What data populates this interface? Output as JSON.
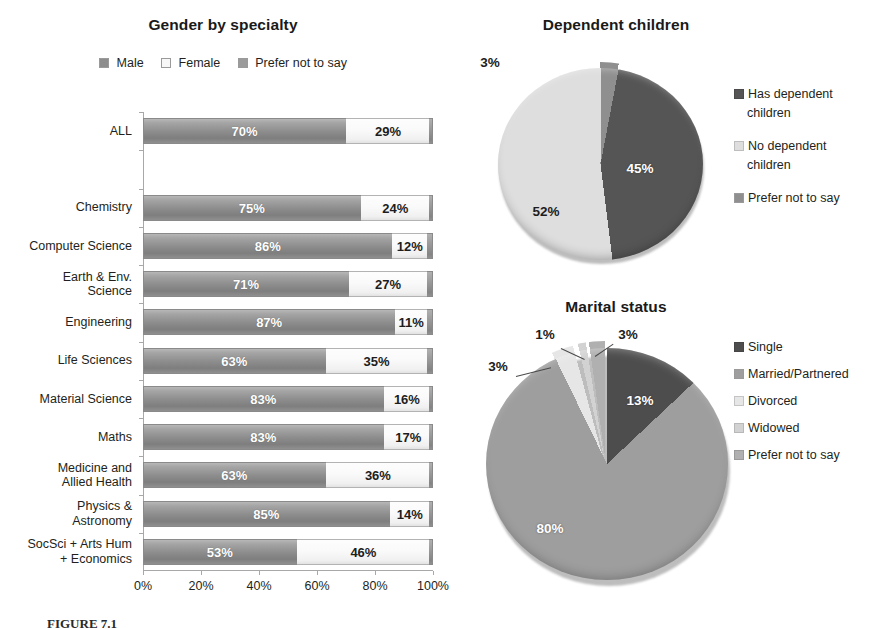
{
  "bar_chart": {
    "title": "Gender by specialty",
    "legend": [
      {
        "label": "Male",
        "color": "#8d8d8d"
      },
      {
        "label": "Female",
        "color": "#f4f4f4"
      },
      {
        "label": "Prefer not to say",
        "color": "#9b9b9b"
      }
    ],
    "xticks": [
      "0%",
      "20%",
      "40%",
      "60%",
      "80%",
      "100%"
    ]
  },
  "chart_data": [
    {
      "type": "bar",
      "orientation": "horizontal",
      "stacked": true,
      "title": "Gender by specialty",
      "xlabel": "",
      "ylabel": "",
      "xlim": [
        0,
        100
      ],
      "grid": false,
      "legend_position": "top",
      "legend": [
        "Male",
        "Female",
        "Prefer not to say"
      ],
      "categories": [
        "ALL",
        "",
        "Chemistry",
        "Computer Science",
        "Earth & Env. Science",
        "Engineering",
        "Life Sciences",
        "Material Science",
        "Maths",
        "Medicine and Allied Health",
        "Physics & Astronomy",
        "SocSci + Arts Hum + Economics"
      ],
      "category_lines": [
        [
          "ALL"
        ],
        [
          ""
        ],
        [
          "Chemistry"
        ],
        [
          "Computer Science"
        ],
        [
          "Earth & Env.",
          "Science"
        ],
        [
          "Engineering"
        ],
        [
          "Life Sciences"
        ],
        [
          "Material Science"
        ],
        [
          "Maths"
        ],
        [
          "Medicine and",
          "Allied Health"
        ],
        [
          "Physics &",
          "Astronomy"
        ],
        [
          "SocSci + Arts Hum",
          "+ Economics"
        ]
      ],
      "series": [
        {
          "name": "Male",
          "values": [
            70,
            null,
            75,
            86,
            71,
            87,
            63,
            83,
            83,
            63,
            85,
            53
          ]
        },
        {
          "name": "Female",
          "values": [
            29,
            null,
            24,
            12,
            27,
            11,
            35,
            16,
            17,
            36,
            14,
            46
          ]
        },
        {
          "name": "Prefer not to say",
          "values": [
            1,
            null,
            1,
            2,
            2,
            2,
            2,
            1,
            0,
            1,
            1,
            1
          ]
        }
      ],
      "value_labels": {
        "male": [
          "70%",
          "",
          "75%",
          "86%",
          "71%",
          "87%",
          "63%",
          "83%",
          "83%",
          "63%",
          "85%",
          "53%"
        ],
        "female": [
          "29%",
          "",
          "24%",
          "12%",
          "27%",
          "11%",
          "35%",
          "16%",
          "17%",
          "36%",
          "14%",
          "46%"
        ]
      }
    },
    {
      "type": "pie",
      "title": "Dependent children",
      "legend_position": "right",
      "labels": [
        "Has dependent children",
        "No dependent children",
        "Prefer not to say"
      ],
      "values": [
        45,
        52,
        3
      ],
      "value_labels": [
        "45%",
        "52%",
        "3%"
      ],
      "colors": [
        "#4f4f4f",
        "#dcdcdc",
        "#8f8f8f"
      ]
    },
    {
      "type": "pie",
      "title": "Marital status",
      "legend_position": "right",
      "labels": [
        "Single",
        "Married/Partnered",
        "Divorced",
        "Widowed",
        "Prefer not to say"
      ],
      "values": [
        13,
        80,
        3,
        1,
        3
      ],
      "value_labels": [
        "13%",
        "80%",
        "3%",
        "1%",
        "3%"
      ],
      "colors": [
        "#4a4a4a",
        "#9c9c9c",
        "#e3e3e3",
        "#cfcfcf",
        "#adadad"
      ]
    }
  ],
  "pie1": {
    "title": "Dependent children",
    "labels": {
      "has": "Has dependent children",
      "has_l1": "Has dependent",
      "has_l2": "children",
      "no": "No dependent children",
      "no_l1": "No dependent",
      "no_l2": "children",
      "prefer": "Prefer not to say"
    },
    "values": {
      "has": "45%",
      "no": "52%",
      "prefer": "3%"
    }
  },
  "pie2": {
    "title": "Marital status",
    "labels": {
      "single": "Single",
      "married": "Married/Partnered",
      "divorced": "Divorced",
      "widowed": "Widowed",
      "prefer": "Prefer not to say"
    },
    "values": {
      "single": "13%",
      "married": "80%",
      "divorced": "3%",
      "widowed": "1%",
      "prefer": "3%"
    }
  },
  "caption": "FIGURE 7.1"
}
